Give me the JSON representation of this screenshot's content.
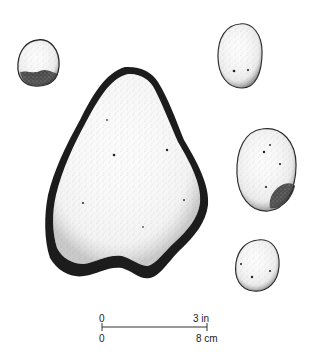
{
  "figure": {
    "artifacts": [
      {
        "id": "small-top-left",
        "shape": "rounded"
      },
      {
        "id": "large-center",
        "shape": "triangular"
      },
      {
        "id": "small-top-right",
        "shape": "oval"
      },
      {
        "id": "medium-right",
        "shape": "oval"
      },
      {
        "id": "small-bottom-right",
        "shape": "rounded"
      }
    ],
    "colors": {
      "ink": "#1a1a1a",
      "background": "#ffffff"
    }
  },
  "scale_bar": {
    "top_start": "0",
    "top_end": "3 in",
    "bottom_start": "0",
    "bottom_end": "8 cm"
  }
}
